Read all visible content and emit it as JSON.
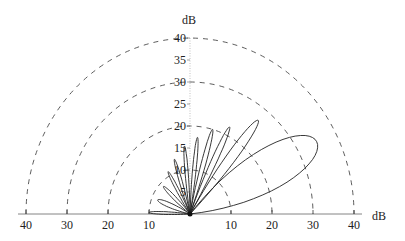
{
  "chart_data": {
    "type": "polar",
    "title": "",
    "radial_unit_label": "dB",
    "horizontal_axis_label": "dB",
    "radial_range": [
      0,
      40
    ],
    "angular_range_deg": [
      0,
      180
    ],
    "rings_dB": [
      10,
      20,
      30,
      40
    ],
    "ring_style": "dashed",
    "horizontal_tick_labels_left": [
      "40",
      "30",
      "20",
      "10"
    ],
    "horizontal_tick_labels_right": [
      "10",
      "20",
      "30",
      "40"
    ],
    "vertical_tick_labels": [
      "5",
      "10",
      "15",
      "20",
      "25",
      "30",
      "35",
      "40"
    ],
    "series": [
      {
        "name": "radiation pattern lobes",
        "lobes": [
          {
            "center_angle_deg": 28,
            "peak_dB": 35,
            "width_deg": 44
          },
          {
            "center_angle_deg": 52,
            "peak_dB": 27,
            "width_deg": 14
          },
          {
            "center_angle_deg": 64,
            "peak_dB": 22,
            "width_deg": 10
          },
          {
            "center_angle_deg": 74,
            "peak_dB": 20,
            "width_deg": 9
          },
          {
            "center_angle_deg": 84,
            "peak_dB": 17.5,
            "width_deg": 8
          },
          {
            "center_angle_deg": 95,
            "peak_dB": 15.5,
            "width_deg": 8
          },
          {
            "center_angle_deg": 107,
            "peak_dB": 13,
            "width_deg": 9
          },
          {
            "center_angle_deg": 119,
            "peak_dB": 11,
            "width_deg": 10
          },
          {
            "center_angle_deg": 136,
            "peak_dB": 9,
            "width_deg": 14
          },
          {
            "center_angle_deg": 158,
            "peak_dB": 8.5,
            "width_deg": 20
          },
          {
            "center_angle_deg": 178,
            "peak_dB": 10,
            "width_deg": 10
          }
        ]
      }
    ],
    "grid": true,
    "legend": null
  },
  "labels": {
    "top_unit": "dB",
    "right_unit": "dB"
  }
}
